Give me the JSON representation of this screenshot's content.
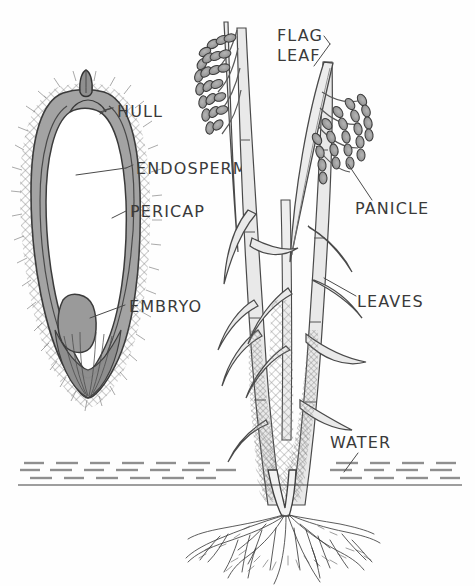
{
  "figure": {
    "background_color": "#fefefe",
    "ink_color": "#3a3a3a",
    "fill_gray": "#9a9a9a",
    "fill_light": "#c8c8c8",
    "fill_white": "#ffffff"
  },
  "labels": {
    "hull": "HULL",
    "endosperm": "ENDOSPERM",
    "pericap": "PERICAP",
    "embryo": "EMBRYO",
    "flag_leaf_line1": "FLAG",
    "flag_leaf_line2": "LEAF",
    "panicle": "PANICLE",
    "leaves": "LEAVES",
    "water": "WATER"
  },
  "diagram_parts": {
    "grain_cross_section": "longitudinal section of a rice grain",
    "plant": "whole rice plant with panicles, leaves, stems and roots",
    "water_line": "dashed water surface line",
    "roots": "fibrous root system below water"
  }
}
